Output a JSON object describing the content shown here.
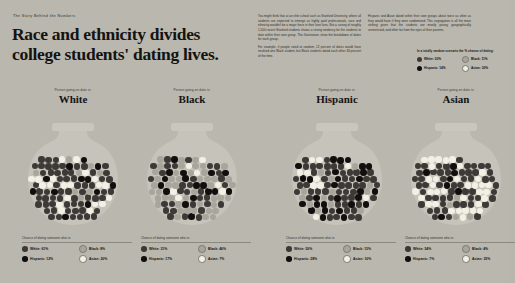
{
  "header": {
    "kicker": "The Story Behind the Numbers",
    "headline": "Race and ethnicity divides college students' dating lives."
  },
  "body_copy": {
    "col1_p1": "You might think that at an elite school such as Stanford University, where all students are expected to emerge as highly paid professionals, race and ethnicity wouldn't be a major force in their love lives. But a survey of roughly 1,500 recent Stanford students shows a strong tendency for the students to date within their own group. The illustrations show the breakdown of dates for each group.",
    "col1_p2": "For example, if people rated at random, 12 percent of dates would have involved one Black student, but Black students dated each other 46 percent of the time.",
    "col2_p1": "Hispanic and Asian dated within their own groups about twice as often as they would have if they were randomized. This segregation is all the more striking given that the students are mostly young, geographically unrestricted, and often far from the eyes of their parents."
  },
  "top_legend": {
    "title": "In a totally random scenario the % chance of dating:",
    "items": [
      {
        "label": "White: 30%",
        "color": "#3c3a36"
      },
      {
        "label": "Black: 11%",
        "color": "#a8a59c"
      },
      {
        "label": "Hispanic: 14%",
        "color": "#100f0d"
      },
      {
        "label": "Asian: 30%",
        "color": "#f2efe4"
      }
    ]
  },
  "chart_data": {
    "type": "pie",
    "title": "Race and ethnicity divides college students' dating lives.",
    "subtitle": "Chance of dating someone who is:",
    "group_kicker": "Person going on date is:",
    "categories": [
      "White",
      "Black",
      "Hispanic",
      "Asian"
    ],
    "colors": {
      "White": "#3c3a36",
      "Black": "#a8a59c",
      "Hispanic": "#100f0d",
      "Asian": "#f2efe4"
    },
    "total_dots": 100,
    "legend_position": "below-each-jar",
    "series": [
      {
        "name": "White",
        "values": [
          61,
          8,
          12,
          20
        ]
      },
      {
        "name": "Black",
        "values": [
          31,
          46,
          17,
          7
        ]
      },
      {
        "name": "Hispanic",
        "values": [
          50,
          13,
          28,
          10
        ]
      },
      {
        "name": "Asian",
        "values": [
          54,
          4,
          7,
          35
        ]
      }
    ],
    "random_baseline": [
      30,
      11,
      14,
      30
    ]
  },
  "jars": [
    {
      "kicker": "Person going on date is:",
      "name": "White",
      "legend_title": "Chance of dating someone who is:",
      "legend": [
        {
          "label": "White: 61%",
          "color": "#3c3a36"
        },
        {
          "label": "Black: 8%",
          "color": "#a8a59c"
        },
        {
          "label": "Hispanic: 12%",
          "color": "#100f0d"
        },
        {
          "label": "Asian: 20%",
          "color": "#f2efe4"
        }
      ]
    },
    {
      "kicker": "Person going on date is:",
      "name": "Black",
      "legend_title": "Chance of dating someone who is:",
      "legend": [
        {
          "label": "White: 31%",
          "color": "#3c3a36"
        },
        {
          "label": "Black: 46%",
          "color": "#a8a59c"
        },
        {
          "label": "Hispanic: 17%",
          "color": "#100f0d"
        },
        {
          "label": "Asian: 7%",
          "color": "#f2efe4"
        }
      ]
    },
    {
      "kicker": "Person going on date is:",
      "name": "Hispanic",
      "legend_title": "Chance of dating someone who is:",
      "legend": [
        {
          "label": "White: 50%",
          "color": "#3c3a36"
        },
        {
          "label": "Black: 13%",
          "color": "#a8a59c"
        },
        {
          "label": "Hispanic: 28%",
          "color": "#100f0d"
        },
        {
          "label": "Asian: 10%",
          "color": "#f2efe4"
        }
      ]
    },
    {
      "kicker": "Person going on date is:",
      "name": "Asian",
      "legend_title": "Chance of dating someone who is:",
      "legend": [
        {
          "label": "White: 54%",
          "color": "#3c3a36"
        },
        {
          "label": "Black: 4%",
          "color": "#a8a59c"
        },
        {
          "label": "Hispanic: 7%",
          "color": "#100f0d"
        },
        {
          "label": "Asian: 35%",
          "color": "#f2efe4"
        }
      ]
    }
  ]
}
